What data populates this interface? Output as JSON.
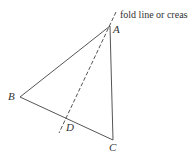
{
  "diagram": {
    "caption": "fold line or crease",
    "vertices": [
      {
        "id": "A",
        "label": "A"
      },
      {
        "id": "B",
        "label": "B"
      },
      {
        "id": "C",
        "label": "C"
      },
      {
        "id": "D",
        "label": "D"
      }
    ],
    "colors": {
      "stroke": "#555555",
      "text": "#333333"
    }
  }
}
